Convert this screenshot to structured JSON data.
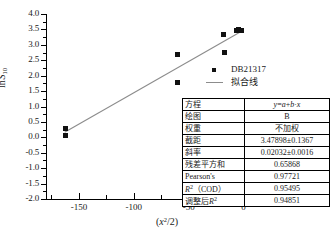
{
  "chart_data": {
    "type": "scatter",
    "title": "",
    "xlabel": "(x²/2)",
    "ylabel": "ln S₁₀",
    "xlim": [
      -180,
      15
    ],
    "ylim": [
      -2.0,
      4.0
    ],
    "grid": false,
    "legend_position": "right",
    "xticks": [
      "-150",
      "-100",
      "-50",
      "0"
    ],
    "xtick_values": [
      -150,
      -100,
      -50,
      0
    ],
    "yticks": [
      "4.0",
      "3.5",
      "3.0",
      "2.5",
      "2.0",
      "1.5",
      "1.0",
      "0.5",
      "0.0",
      "-0.5",
      "-1.0",
      "-1.5",
      "-2.0"
    ],
    "ytick_values": [
      4.0,
      3.5,
      3.0,
      2.5,
      2.0,
      1.5,
      1.0,
      0.5,
      0.0,
      -0.5,
      -1.0,
      -1.5,
      -2.0
    ],
    "series": [
      {
        "name": "DB21317",
        "type": "scatter",
        "marker": "square",
        "color": "#111111",
        "points": [
          {
            "x": -162.5,
            "y": 0.28
          },
          {
            "x": -162.5,
            "y": 0.06
          },
          {
            "x": -60.0,
            "y": 2.7
          },
          {
            "x": -60.5,
            "y": 1.78
          },
          {
            "x": -18.0,
            "y": 3.34
          },
          {
            "x": -17.5,
            "y": 2.74
          },
          {
            "x": -6.0,
            "y": 3.45
          },
          {
            "x": -5.0,
            "y": 3.5
          },
          {
            "x": -1.5,
            "y": 3.48
          }
        ]
      },
      {
        "name": "拟合线",
        "type": "line",
        "color": "#8c8c8c",
        "equation": "y = 3.47898 + 0.02032 * x",
        "endpoints": [
          {
            "x": -163.0,
            "y": 0.166
          },
          {
            "x": -1.0,
            "y": 3.459
          }
        ]
      }
    ]
  },
  "legend": {
    "items": [
      {
        "label": "DB21317",
        "symbol": "square-marker"
      },
      {
        "label": "拟合线",
        "symbol": "line-swatch"
      }
    ]
  },
  "stats_table": {
    "rows": [
      {
        "key": "方程",
        "value": "y=a+b·x",
        "value_style": "equation"
      },
      {
        "key": "绘图",
        "value": "B"
      },
      {
        "key": "权重",
        "value": "不加权"
      },
      {
        "key": "截距",
        "value": "3.47898±0.1367"
      },
      {
        "key": "斜率",
        "value": "0.02032±0.0016"
      },
      {
        "key": "残差平方和",
        "value": "0.65868"
      },
      {
        "key": "Pearson's",
        "value": "0.97721"
      },
      {
        "key": "R²（COD）",
        "value": "0.95495",
        "key_style": "r2cod"
      },
      {
        "key": "调整后R²",
        "value": "0.94851",
        "key_style": "adjr2"
      }
    ]
  },
  "colors": {
    "marker": "#111111",
    "fit_line": "#8c8c8c",
    "axis": "#000000",
    "background": "#ffffff"
  }
}
